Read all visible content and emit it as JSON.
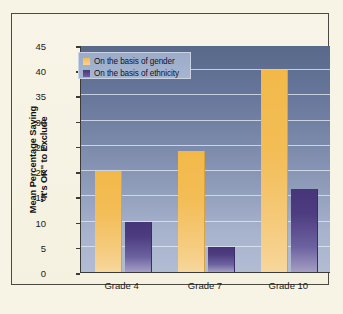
{
  "chart_data": {
    "type": "bar",
    "title": "",
    "subtitle": "",
    "xlabel": "",
    "ylabel": "Mean Percentage Saying \"It's OK\" to Exclude",
    "ylabel_line1": "Mean Percentage Saying",
    "ylabel_line2": "\"It's OK\" to Exclude",
    "categories": [
      "Grade 4",
      "Grade 7",
      "Grade 10"
    ],
    "series": [
      {
        "name": "On the basis of gender",
        "color": "#f2b949",
        "values": [
          20,
          24,
          40
        ]
      },
      {
        "name": "On the basis of ethnicity",
        "color": "#463679",
        "values": [
          10,
          5,
          16.5
        ]
      }
    ],
    "ylim": [
      0,
      45
    ],
    "yticks": [
      0,
      5,
      10,
      15,
      20,
      25,
      30,
      35,
      40,
      45
    ],
    "ytick_labels": [
      "0",
      "5",
      "10",
      "15",
      "20",
      "25",
      "30",
      "35",
      "40",
      "45"
    ],
    "grid": true,
    "legend_position": "top-left",
    "background_color": "#f7f4e6",
    "plot_gradient_top": "#59698a",
    "plot_gradient_bottom": "#b2bdd4",
    "frame_color": "#4a4a40"
  }
}
